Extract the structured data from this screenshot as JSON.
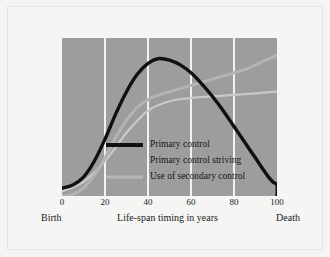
{
  "chart_data": {
    "type": "line",
    "title": "",
    "xlabel": "Life-span timing in years",
    "ylabel": "Availability/use of control",
    "xlim": [
      0,
      100
    ],
    "ylim": [
      0,
      100
    ],
    "xticks": [
      0,
      20,
      40,
      60,
      80,
      100
    ],
    "xtick_labels": [
      "0",
      "20",
      "40",
      "60",
      "80",
      "100"
    ],
    "ytick_labels": [],
    "grid": "vertical-only",
    "legend_position": "inside-lower-left",
    "axis_endpoint_labels": {
      "left": "Birth",
      "right": "Death"
    },
    "series": [
      {
        "name": "Primary control",
        "color": "#111111",
        "width": 3.4,
        "x": [
          0,
          5,
          10,
          15,
          20,
          25,
          30,
          35,
          40,
          45,
          50,
          55,
          60,
          65,
          70,
          75,
          80,
          85,
          90,
          95,
          98,
          100,
          100
        ],
        "values": [
          5,
          7,
          12,
          22,
          36,
          52,
          66,
          77,
          84,
          87,
          86,
          83,
          78,
          71,
          63,
          54,
          44,
          34,
          24,
          14,
          9,
          7,
          0
        ]
      },
      {
        "name": "Primary control striving",
        "color": "#c9c9c9",
        "width": 2.2,
        "x": [
          0,
          10,
          20,
          30,
          40,
          50,
          60,
          70,
          80,
          90,
          100
        ],
        "values": [
          3,
          9,
          22,
          40,
          54,
          60,
          62,
          63,
          64,
          65,
          66
        ]
      },
      {
        "name": "Use of secondary control",
        "color": "#b4b4b4",
        "width": 3.0,
        "x": [
          0,
          5,
          10,
          15,
          20,
          25,
          30,
          35,
          40,
          45,
          50,
          55,
          60,
          65,
          70,
          75,
          80,
          85,
          90,
          95,
          100
        ],
        "values": [
          0,
          1,
          5,
          13,
          24,
          37,
          48,
          56,
          61,
          64,
          66,
          68,
          70,
          72,
          74,
          76,
          78,
          80,
          83,
          86,
          89
        ]
      }
    ]
  },
  "legend": {
    "items": [
      {
        "label": "Primary control",
        "color": "#111111",
        "thickness": 4,
        "visible_swatch": true
      },
      {
        "label": "Primary control striving",
        "color": "#9d9d9d",
        "thickness": 2,
        "visible_swatch": false
      },
      {
        "label": "Use of secondary control",
        "color": "#b7b7b7",
        "thickness": 3,
        "visible_swatch": true
      }
    ]
  },
  "colors": {
    "page_background": "#f4f4f2",
    "plot_background": "#9d9d9d",
    "gridline": "#f2f2f0",
    "primary_control": "#111111",
    "secondary_control": "#b7b7b7",
    "text": "#1a1a1a"
  }
}
